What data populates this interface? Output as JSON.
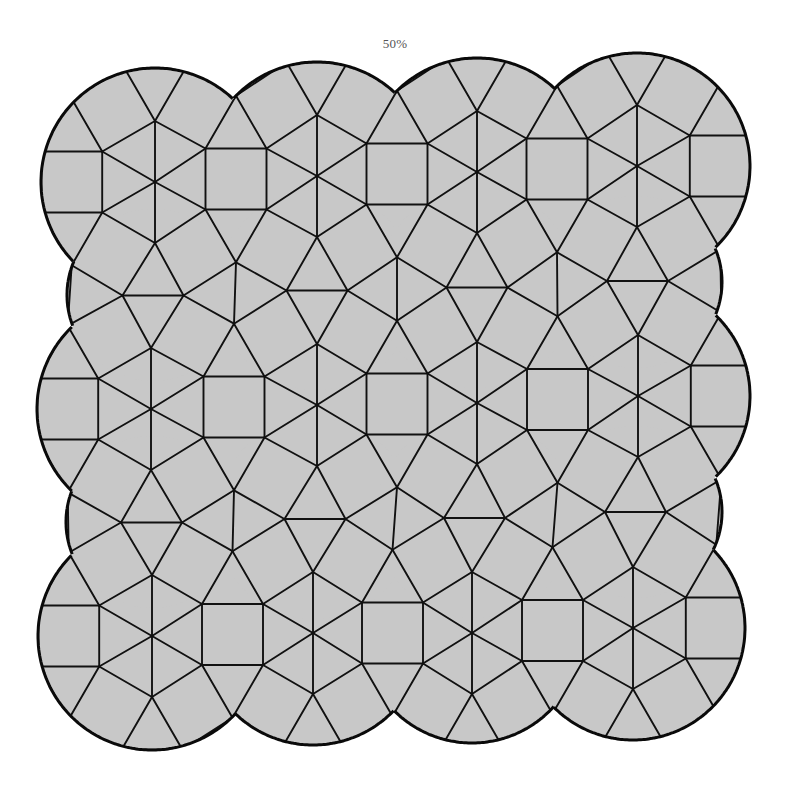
{
  "figure": {
    "caption": "50%",
    "fill_color": "#c8c8c8",
    "line_color": "#111111",
    "outline_color": "#0a0a0a",
    "edge_length": 61,
    "units": [
      {
        "row": 1,
        "col": 1,
        "cx": 155,
        "cy": 182
      },
      {
        "row": 1,
        "col": 2,
        "cx": 317,
        "cy": 176
      },
      {
        "row": 1,
        "col": 3,
        "cx": 477,
        "cy": 172
      },
      {
        "row": 1,
        "col": 4,
        "cx": 637,
        "cy": 166
      },
      {
        "row": 2,
        "col": 1,
        "cx": 151,
        "cy": 409
      },
      {
        "row": 2,
        "col": 2,
        "cx": 317,
        "cy": 405
      },
      {
        "row": 2,
        "col": 3,
        "cx": 477,
        "cy": 403
      },
      {
        "row": 2,
        "col": 4,
        "cx": 638,
        "cy": 396
      },
      {
        "row": 3,
        "col": 1,
        "cx": 152,
        "cy": 636
      },
      {
        "row": 3,
        "col": 2,
        "cx": 313,
        "cy": 633
      },
      {
        "row": 3,
        "col": 3,
        "cx": 472,
        "cy": 633
      },
      {
        "row": 3,
        "col": 4,
        "cx": 633,
        "cy": 628
      }
    ],
    "outline_circles": [
      {
        "cx": 155,
        "cy": 182,
        "r": 114
      },
      {
        "cx": 317,
        "cy": 176,
        "r": 114
      },
      {
        "cx": 477,
        "cy": 172,
        "r": 114
      },
      {
        "cx": 637,
        "cy": 166,
        "r": 113
      },
      {
        "cx": 151,
        "cy": 409,
        "r": 114
      },
      {
        "cx": 317,
        "cy": 405,
        "r": 114
      },
      {
        "cx": 477,
        "cy": 403,
        "r": 114
      },
      {
        "cx": 638,
        "cy": 396,
        "r": 112
      },
      {
        "cx": 152,
        "cy": 636,
        "r": 114
      },
      {
        "cx": 313,
        "cy": 633,
        "r": 112
      },
      {
        "cx": 472,
        "cy": 633,
        "r": 110
      },
      {
        "cx": 633,
        "cy": 628,
        "r": 112
      },
      {
        "cx": 153,
        "cy": 295,
        "r": 86
      },
      {
        "cx": 636,
        "cy": 282,
        "r": 86
      },
      {
        "cx": 152,
        "cy": 522,
        "r": 86
      },
      {
        "cx": 636,
        "cy": 512,
        "r": 86
      },
      {
        "cx": 317,
        "cy": 290,
        "r": 100
      },
      {
        "cx": 477,
        "cy": 288,
        "r": 100
      },
      {
        "cx": 315,
        "cy": 519,
        "r": 100
      },
      {
        "cx": 475,
        "cy": 518,
        "r": 100
      }
    ]
  }
}
